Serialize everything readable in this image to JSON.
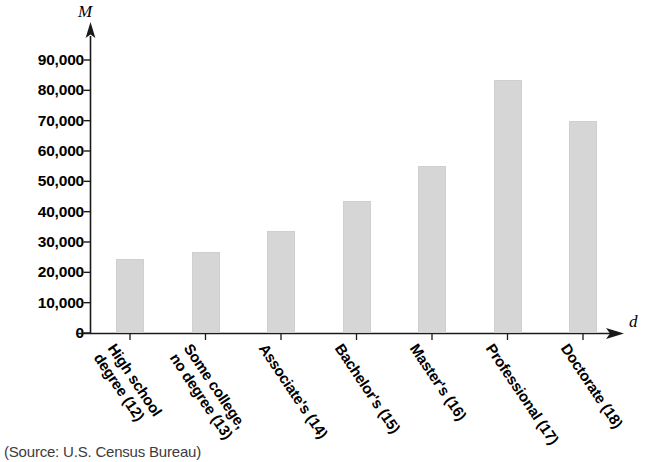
{
  "chart_data": {
    "type": "bar",
    "title": "",
    "subtitle": "",
    "xlabel": "d",
    "ylabel": "M",
    "categories": [
      "High school\ndegree (12)",
      "Some college,\nno degree (13)",
      "Associate's (14)",
      "Bachelor's (15)",
      "Master's (16)",
      "Professional (17)",
      "Doctorate (18)"
    ],
    "values": [
      24400,
      26800,
      33600,
      43500,
      55000,
      83500,
      69800
    ],
    "ylim": [
      0,
      95000
    ],
    "yticks": [
      0,
      10000,
      20000,
      30000,
      40000,
      50000,
      60000,
      70000,
      80000,
      90000
    ],
    "ytick_labels": [
      "0",
      "10,000",
      "20,000",
      "30,000",
      "40,000",
      "50,000",
      "60,000",
      "70,000",
      "80,000",
      "90,000"
    ],
    "grid": false,
    "legend": null,
    "bar_color": "#d6d6d6",
    "axis_color": "#1a1a1a",
    "source": "(Source: U.S. Census Bureau)"
  },
  "axes": {
    "y_variable": "M",
    "x_variable": "d"
  },
  "source_note": "(Source: U.S. Census Bureau)"
}
